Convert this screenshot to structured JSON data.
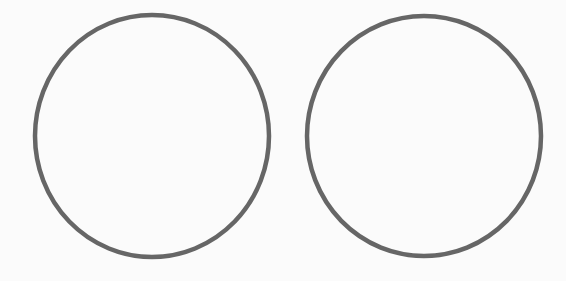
{
  "canvas": {
    "width": 566,
    "height": 281,
    "background": "#fbfbfb"
  },
  "stroke_color": "#666666",
  "shapes": [
    {
      "type": "circle",
      "name": "left-circle",
      "cx": 152,
      "cy": 136,
      "rx": 117,
      "ry": 121,
      "stroke_width": 4.5
    },
    {
      "type": "circle",
      "name": "right-circle",
      "cx": 424,
      "cy": 136,
      "rx": 117,
      "ry": 120,
      "stroke_width": 4.5
    }
  ]
}
